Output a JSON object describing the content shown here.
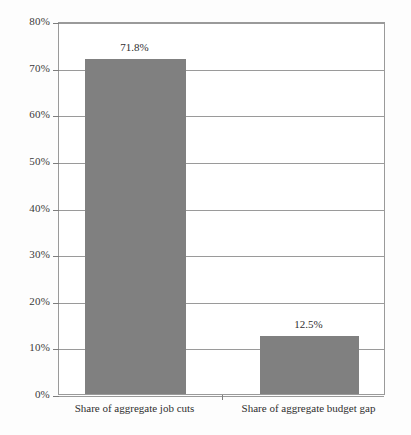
{
  "chart_data": {
    "type": "bar",
    "title": "",
    "xlabel": "",
    "ylabel": "",
    "categories": [
      "Share of aggregate job cuts",
      "Share of aggregate budget gap"
    ],
    "values": [
      71.8,
      12.5
    ],
    "value_labels": [
      "71.8%",
      "12.5%"
    ],
    "ylim": [
      0,
      80
    ],
    "ytick_step": 10,
    "ytick_labels": [
      "80%",
      "70%",
      "60%",
      "50%",
      "40%",
      "30%",
      "20%",
      "10%",
      "0%"
    ],
    "ytick_values": [
      80,
      70,
      60,
      50,
      40,
      30,
      20,
      10,
      0
    ],
    "grid": true,
    "legend": false,
    "series": [
      {
        "name": "",
        "values": [
          71.8,
          12.5
        ],
        "color": "#808080"
      }
    ]
  },
  "style": {
    "bar_color": "#808080",
    "grid_color": "#9a9a9a",
    "axis_color": "#7d7d7d",
    "text_color": "#2f2f2f",
    "background": "#ffffff"
  }
}
